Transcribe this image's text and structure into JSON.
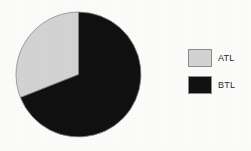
{
  "chart_data": {
    "type": "pie",
    "title": "",
    "categories": [
      "ATL",
      "BTL"
    ],
    "values": [
      31,
      69
    ],
    "unit": "percent",
    "colors": [
      "#d4d4d4",
      "#111111"
    ],
    "slice_border_color": "#8d8d8d",
    "start_angle_deg": 0,
    "direction": "counterclockwise",
    "legend": {
      "position": "right",
      "entries": [
        {
          "label": "ATL",
          "color": "#d4d4d4",
          "swatch": "legend-swatch-atl"
        },
        {
          "label": "BTL",
          "color": "#111111",
          "swatch": "legend-swatch-btl"
        }
      ]
    },
    "geometry": {
      "center_x": 78,
      "center_y": 74.5,
      "radius": 63
    },
    "grid": false,
    "xlabel": "",
    "ylabel": "",
    "annotations": []
  },
  "background_color": "#fdfdfc"
}
